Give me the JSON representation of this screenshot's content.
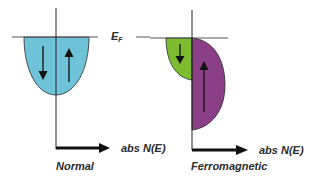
{
  "diagram": {
    "fermi_label": "E",
    "fermi_subscript": "F",
    "panels": [
      {
        "name": "Normal",
        "title": "Normal",
        "axis_label": "abs N(E)",
        "bands": [
          {
            "spin": "down",
            "color": "#6fc3d8"
          },
          {
            "spin": "up",
            "color": "#6fc3d8"
          }
        ]
      },
      {
        "name": "Ferromagnetic",
        "title": "Ferromagnetic",
        "axis_label": "abs N(E)",
        "bands": [
          {
            "spin": "down",
            "color": "#7dbb2f"
          },
          {
            "spin": "up",
            "color": "#8a3f86"
          }
        ]
      }
    ]
  }
}
